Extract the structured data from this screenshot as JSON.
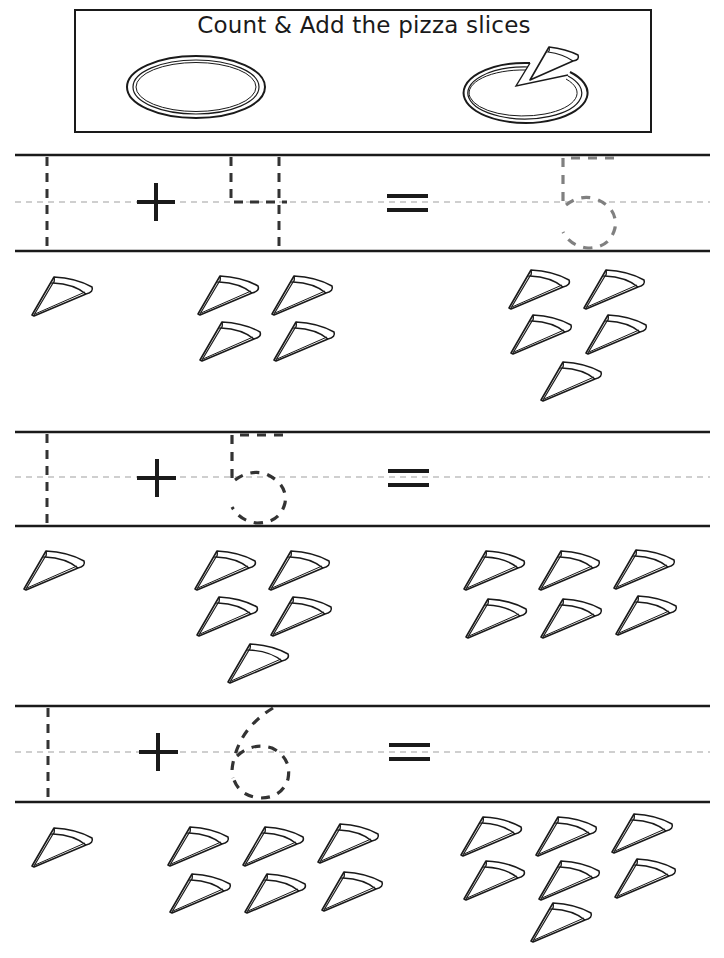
{
  "worksheet": {
    "title": "Count & Add the pizza slices",
    "colors": {
      "ink": "#1a1a1a",
      "trace_dark": "#333333",
      "trace_gray": "#808080",
      "midline": "#a0a0a0",
      "paper": "#ffffff"
    },
    "header_images": [
      {
        "name": "whole-pizza",
        "description": "whole pizza"
      },
      {
        "name": "pizza-with-slice-removed",
        "description": "pizza with one slice taken out"
      }
    ],
    "problems": [
      {
        "index": 1,
        "addend1_trace": "1",
        "operator": "+",
        "addend2_trace": "4",
        "equals": "=",
        "sum_trace": "5",
        "addend1_slices": 1,
        "addend2_slices": 4,
        "sum_slices": 5
      },
      {
        "index": 2,
        "addend1_trace": "1",
        "operator": "+",
        "addend2_trace": "5",
        "equals": "=",
        "sum_trace": "",
        "addend1_slices": 1,
        "addend2_slices": 5,
        "sum_slices": 6
      },
      {
        "index": 3,
        "addend1_trace": "1",
        "operator": "+",
        "addend2_trace": "6",
        "equals": "=",
        "sum_trace": "",
        "addend1_slices": 1,
        "addend2_slices": 6,
        "sum_slices": 7
      }
    ]
  }
}
